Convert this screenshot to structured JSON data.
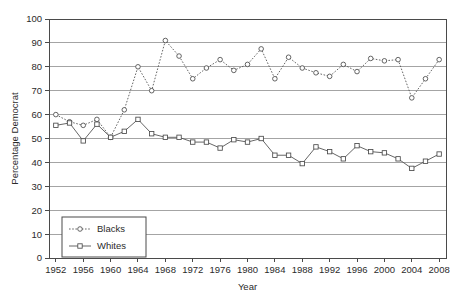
{
  "chart_data": {
    "type": "line",
    "title": "",
    "xlabel": "Year",
    "ylabel": "Percentage Democrat",
    "xlim": [
      1951,
      2009
    ],
    "ylim": [
      0,
      100
    ],
    "ytick_step": 10,
    "yticks": [
      0,
      10,
      20,
      30,
      40,
      50,
      60,
      70,
      80,
      90,
      100
    ],
    "xticks": [
      1952,
      1956,
      1960,
      1964,
      1968,
      1972,
      1976,
      1980,
      1984,
      1988,
      1992,
      1996,
      2000,
      2004,
      2008
    ],
    "xticklabels": [
      "1952",
      "1956",
      "1960",
      "1964",
      "1968",
      "1972",
      "1976",
      "1980",
      "1984",
      "1988",
      "1992",
      "1996",
      "2000",
      "2004",
      "2008"
    ],
    "yticklabels": [
      "0",
      "10",
      "20",
      "30",
      "40",
      "50",
      "60",
      "70",
      "80",
      "90",
      "100"
    ],
    "grid": "horizontal",
    "legend_position": "lower-left",
    "x": [
      1952,
      1954,
      1956,
      1958,
      1960,
      1962,
      1964,
      1966,
      1968,
      1970,
      1972,
      1974,
      1976,
      1978,
      1980,
      1982,
      1984,
      1986,
      1988,
      1990,
      1992,
      1994,
      1996,
      1998,
      2000,
      2002,
      2004,
      2006,
      2008
    ],
    "series": [
      {
        "name": "Blacks",
        "marker": "circle",
        "linestyle": "dotted",
        "values": [
          60.0,
          57.0,
          55.5,
          58.0,
          50.5,
          62.0,
          80.0,
          70.0,
          91.0,
          84.5,
          75.0,
          79.5,
          83.0,
          78.5,
          81.0,
          87.5,
          75.0,
          84.0,
          79.5,
          77.5,
          76.0,
          81.0,
          78.0,
          83.5,
          82.5,
          83.0,
          67.0,
          75.0,
          83.0
        ]
      },
      {
        "name": "Whites",
        "marker": "square",
        "linestyle": "solid",
        "values": [
          55.5,
          56.5,
          49.0,
          56.0,
          50.5,
          53.0,
          58.0,
          52.0,
          50.5,
          50.5,
          48.5,
          48.5,
          46.0,
          49.5,
          48.5,
          50.0,
          43.0,
          43.0,
          39.5,
          46.5,
          44.5,
          41.5,
          47.0,
          44.5,
          44.0,
          41.5,
          37.5,
          40.5,
          43.5
        ]
      }
    ],
    "legend_entries": [
      {
        "label": "Blacks",
        "marker": "circle",
        "linestyle": "dotted"
      },
      {
        "label": "Whites",
        "marker": "square",
        "linestyle": "solid"
      }
    ]
  }
}
